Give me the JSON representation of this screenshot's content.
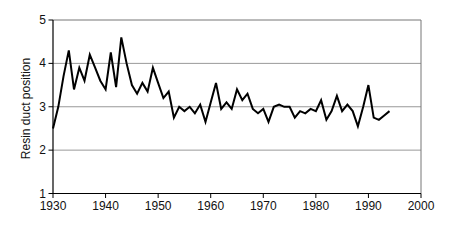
{
  "figure": {
    "background": "#ffffff",
    "title": ""
  },
  "chart_data": {
    "type": "line",
    "title": "",
    "xlabel": "",
    "ylabel": "Resin duct position",
    "legend": "none",
    "grid": "horizontal",
    "xlim": [
      1930,
      2000
    ],
    "ylim": [
      1,
      5
    ],
    "xticks": [
      1930,
      1940,
      1950,
      1960,
      1970,
      1980,
      1990,
      2000
    ],
    "yticks": [
      1,
      2,
      3,
      4,
      5
    ],
    "gridline_values": [
      2,
      3,
      4
    ],
    "line_color": "#000000",
    "line_width": 2,
    "grid_color": "#999999",
    "border_color": "#777777",
    "axis_color": "#000000",
    "tick_label_color": "#111111",
    "series_name": "resin-duct-position",
    "years": [
      1930,
      1931,
      1932,
      1933,
      1934,
      1935,
      1936,
      1937,
      1938,
      1939,
      1940,
      1941,
      1942,
      1943,
      1944,
      1945,
      1946,
      1947,
      1948,
      1949,
      1950,
      1951,
      1952,
      1953,
      1954,
      1955,
      1956,
      1957,
      1958,
      1959,
      1960,
      1961,
      1962,
      1963,
      1964,
      1965,
      1966,
      1967,
      1968,
      1969,
      1970,
      1971,
      1972,
      1973,
      1974,
      1975,
      1976,
      1977,
      1978,
      1979,
      1980,
      1981,
      1982,
      1983,
      1984,
      1985,
      1986,
      1987,
      1988,
      1989,
      1990,
      1991,
      1992,
      1993,
      1994
    ],
    "values": [
      2.5,
      3.0,
      3.7,
      4.3,
      3.4,
      3.9,
      3.6,
      4.2,
      3.9,
      3.6,
      3.4,
      4.25,
      3.45,
      4.6,
      4.0,
      3.5,
      3.3,
      3.55,
      3.35,
      3.9,
      3.55,
      3.2,
      3.35,
      2.75,
      3.0,
      2.9,
      3.0,
      2.85,
      3.05,
      2.65,
      3.1,
      3.55,
      2.95,
      3.1,
      2.95,
      3.4,
      3.15,
      3.3,
      2.95,
      2.85,
      2.95,
      2.65,
      3.0,
      3.05,
      3.0,
      3.0,
      2.75,
      2.9,
      2.85,
      2.95,
      2.9,
      3.15,
      2.7,
      2.9,
      3.25,
      2.9,
      3.05,
      2.9,
      2.55,
      3.0,
      3.5,
      2.75,
      2.7,
      2.8,
      2.9
    ]
  }
}
